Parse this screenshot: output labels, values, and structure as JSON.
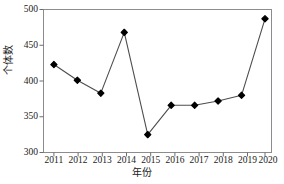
{
  "chart_data": {
    "type": "line",
    "title": "",
    "xlabel": "年份",
    "ylabel": "个体数",
    "categories": [
      "2011",
      "2012",
      "2013",
      "2014",
      "2015",
      "2016",
      "2017",
      "2018",
      "2019",
      "2020"
    ],
    "values": [
      423,
      401,
      383,
      468,
      325,
      366,
      366,
      372,
      380,
      487
    ],
    "series": [
      {
        "name": "个体数",
        "values": [
          423,
          401,
          383,
          468,
          325,
          366,
          366,
          372,
          380,
          487
        ]
      }
    ],
    "ylim": [
      300,
      500
    ],
    "yticks": [
      300,
      350,
      400,
      450,
      500
    ],
    "ytick_labels": [
      "300",
      "350",
      "400",
      "450",
      "500"
    ],
    "xtick_labels": [
      "2011",
      "2012",
      "2013",
      "2014",
      "2015",
      "2016",
      "2017",
      "2018",
      "2019",
      "2020"
    ],
    "grid": false,
    "legend": null,
    "marker": "diamond",
    "marker_color": "#000000",
    "line_color": "#4d4d4d",
    "axis_color": "#808080",
    "background": "#ffffff"
  },
  "axes": {
    "y_title": "个体数",
    "x_title": "年份"
  }
}
